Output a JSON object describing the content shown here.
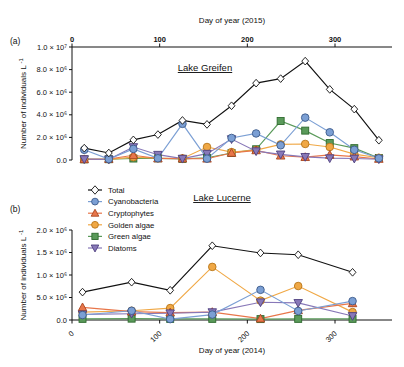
{
  "figure": {
    "panel_a_label": "(a)",
    "panel_b_label": "(b)",
    "y_axis_title": "Number of individuals L",
    "y_axis_exponent": "-1"
  },
  "legend": {
    "position": "upper-left-of-panel-b",
    "entries": [
      {
        "label": "Total",
        "color": "#ffffff",
        "edge": "#111111",
        "marker": "diamond"
      },
      {
        "label": "Cyanobacteria",
        "color": "#7b9fd4",
        "edge": "#3c5a8a",
        "marker": "circle"
      },
      {
        "label": "Cryptophytes",
        "color": "#e8764a",
        "edge": "#a8441f",
        "marker": "triangle-up"
      },
      {
        "label": "Golden algae",
        "color": "#f0a845",
        "edge": "#b8761a",
        "marker": "circle"
      },
      {
        "label": "Green algae",
        "color": "#5a9a5a",
        "edge": "#2f6b2f",
        "marker": "square"
      },
      {
        "label": "Diatoms",
        "color": "#8878b8",
        "edge": "#4f4180",
        "marker": "triangle-down"
      }
    ]
  },
  "chart_data": [
    {
      "type": "line",
      "panel": "a",
      "title": "Lake Greifen",
      "xlabel": "Day of year (2015)",
      "xlabel_position": "top",
      "ylabel": "Number of individuals L-1",
      "xlim": [
        0,
        365
      ],
      "ylim": [
        0,
        10000000
      ],
      "xticks": [
        0,
        100,
        200,
        300
      ],
      "xtick_labels": [
        "0",
        "100",
        "200",
        "300"
      ],
      "yticks": [
        0,
        2000000,
        4000000,
        6000000,
        8000000,
        10000000
      ],
      "ytick_labels": [
        "0.0",
        "2.0 × 10⁶",
        "4.0 × 10⁶",
        "6.0 × 10⁶",
        "8.0 × 10⁶",
        "1.0 × 10⁷"
      ],
      "grid": false,
      "x": [
        14,
        42,
        70,
        98,
        126,
        154,
        182,
        210,
        238,
        266,
        294,
        322,
        350
      ],
      "series": [
        {
          "name": "Total",
          "values": [
            1050000,
            620000,
            1780000,
            2250000,
            3500000,
            3150000,
            4800000,
            6800000,
            7200000,
            8750000,
            6250000,
            4500000,
            1750000
          ]
        },
        {
          "name": "Cyanobacteria",
          "values": [
            900000,
            80000,
            980000,
            150000,
            3200000,
            120000,
            1950000,
            2350000,
            1300000,
            3750000,
            2450000,
            900000,
            150000
          ]
        },
        {
          "name": "Cryptophytes",
          "values": [
            60000,
            90000,
            420000,
            130000,
            120000,
            110000,
            620000,
            850000,
            380000,
            250000,
            450000,
            300000,
            90000
          ]
        },
        {
          "name": "Golden algae",
          "values": [
            70000,
            60000,
            250000,
            170000,
            140000,
            1150000,
            700000,
            880000,
            1380000,
            1420000,
            1150000,
            520000,
            200000
          ]
        },
        {
          "name": "Green algae",
          "values": [
            60000,
            70000,
            130000,
            150000,
            100000,
            200000,
            620000,
            950000,
            3450000,
            2600000,
            1500000,
            1050000,
            180000
          ]
        },
        {
          "name": "Diatoms",
          "values": [
            80000,
            60000,
            1150000,
            470000,
            120000,
            560000,
            1850000,
            780000,
            500000,
            280000,
            160000,
            130000,
            70000
          ]
        }
      ]
    },
    {
      "type": "line",
      "panel": "b",
      "title": "Lake Lucerne",
      "xlabel": "Day of year (2014)",
      "xlabel_position": "bottom",
      "ylabel": "Number of individuals L-1",
      "xlim": [
        0,
        365
      ],
      "ylim": [
        0,
        2000000
      ],
      "xticks": [
        0,
        100,
        200,
        300
      ],
      "xtick_labels": [
        "0",
        "100",
        "200",
        "300"
      ],
      "yticks": [
        0,
        500000,
        1000000,
        1500000,
        2000000
      ],
      "ytick_labels": [
        "0.0",
        "5.0 × 10⁵",
        "1.0 × 10⁶",
        "1.5 × 10⁶",
        "2.0 × 10⁶"
      ],
      "grid": false,
      "x": [
        12,
        68,
        112,
        160,
        215,
        258,
        320
      ],
      "series": [
        {
          "name": "Total",
          "values": [
            620000,
            840000,
            660000,
            1650000,
            1490000,
            1450000,
            1060000
          ]
        },
        {
          "name": "Cyanobacteria",
          "values": [
            110000,
            205000,
            20000,
            120000,
            670000,
            200000,
            420000
          ]
        },
        {
          "name": "Cryptophytes",
          "values": [
            280000,
            185000,
            165000,
            175000,
            30000,
            215000,
            370000
          ]
        },
        {
          "name": "Golden algae",
          "values": [
            175000,
            205000,
            265000,
            1180000,
            430000,
            755000,
            175000
          ]
        },
        {
          "name": "Green algae",
          "values": [
            25000,
            30000,
            25000,
            25000,
            20000,
            25000,
            25000
          ]
        },
        {
          "name": "Diatoms",
          "values": [
            125000,
            140000,
            150000,
            175000,
            395000,
            380000,
            90000
          ]
        }
      ]
    }
  ]
}
